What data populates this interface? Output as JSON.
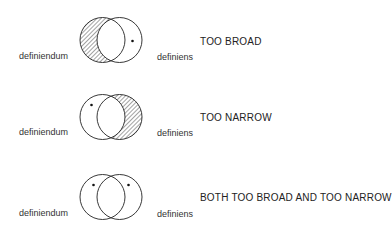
{
  "diagrams": [
    {
      "left_label": "definiendum",
      "right_label": "definiens",
      "verdict": "TOO BROAD",
      "shaded_region": "definiendum-only",
      "dots": [
        "definiens-only"
      ]
    },
    {
      "left_label": "definiendum",
      "right_label": "definiens",
      "verdict": "TOO NARROW",
      "shaded_region": "definiens-only",
      "dots": [
        "definiendum-only"
      ]
    },
    {
      "left_label": "definiendum",
      "right_label": "definiens",
      "verdict": "BOTH TOO BROAD AND TOO NARROW",
      "shaded_region": "none",
      "dots": [
        "definiendum-only",
        "definiens-only"
      ]
    }
  ],
  "colors": {
    "stroke": "#222222",
    "hatch": "#333333",
    "background": "#ffffff"
  }
}
